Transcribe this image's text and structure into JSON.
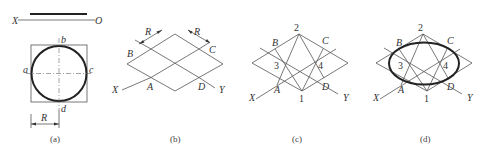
{
  "panels": {
    "a": {
      "caption": "(a)",
      "axis_labels": {
        "x": "X",
        "o": "O"
      },
      "points": {
        "a": "a",
        "b": "b",
        "c": "c",
        "d": "d"
      },
      "dimension": "R"
    },
    "b": {
      "caption": "(b)",
      "points": {
        "A": "A",
        "B": "B",
        "C": "C",
        "D": "D"
      },
      "axes": {
        "x": "X",
        "y": "Y"
      },
      "dimension_left": "R",
      "dimension_right": "R"
    },
    "c": {
      "caption": "(c)",
      "points": {
        "A": "A",
        "B": "B",
        "C": "C",
        "D": "D"
      },
      "centers": {
        "c1": "1",
        "c2": "2",
        "c3": "3",
        "c4": "4"
      },
      "axes": {
        "x": "X",
        "y": "Y"
      }
    },
    "d": {
      "caption": "(d)",
      "points": {
        "A": "A",
        "B": "B",
        "C": "C",
        "D": "D"
      },
      "centers": {
        "c1": "1",
        "c2": "2",
        "c3": "3",
        "c4": "4"
      },
      "axes": {
        "x": "X",
        "y": "Y"
      }
    }
  }
}
